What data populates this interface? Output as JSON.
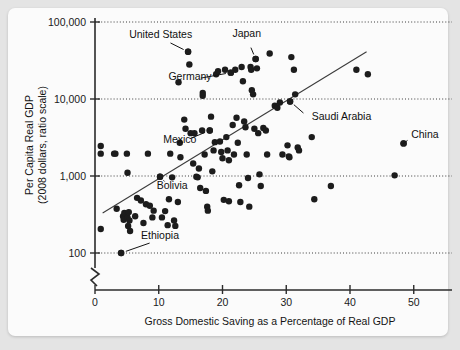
{
  "figure": {
    "title_fragment": "",
    "background_color": "#e4e4e4",
    "card_color": "#fbfbfb"
  },
  "chart_data": {
    "type": "scatter",
    "title": "",
    "xlabel": "Gross Domestic Saving as a Percentage of Real GDP",
    "ylabel_line1": "Per Capita Real GDP",
    "ylabel_line2": "(2008 dollars, ratio scale)",
    "xlim": [
      0,
      56
    ],
    "ylim": [
      100,
      100000
    ],
    "yscale": "log",
    "grid": true,
    "grid_orientation": "horizontal",
    "legend": "none",
    "xticks": [
      0,
      10,
      20,
      30,
      40,
      50
    ],
    "xtick_labels": [
      "0",
      "10",
      "20",
      "30",
      "40",
      "50"
    ],
    "yticks": [
      100,
      1000,
      10000,
      100000
    ],
    "ytick_labels": [
      "100",
      "1,000",
      "10,000",
      "100,000"
    ],
    "axis_break_y": true,
    "marker_color": "#1c1c1c",
    "marker_size": 3.2,
    "trend_line": {
      "label": "fitted trend",
      "x_start": 1.2,
      "y_start": 330,
      "x_end": 42.6,
      "y_end": 41000,
      "color": "#3c3c3c"
    },
    "annotations": [
      {
        "label": "United States",
        "x": 14.6,
        "y": 41000,
        "text_x": 10.3,
        "text_y": 62000,
        "anchor": "middle"
      },
      {
        "label": "Japan",
        "x": 25.2,
        "y": 33000,
        "text_x": 23.8,
        "text_y": 63000,
        "anchor": "middle"
      },
      {
        "label": "Germany",
        "x": 21.3,
        "y": 22000,
        "text_x": 14.9,
        "text_y": 17600,
        "anchor": "middle"
      },
      {
        "label": "Saudi Arabia",
        "x": 30.6,
        "y": 9300,
        "text_x": 34.0,
        "text_y": 5300,
        "anchor": "start"
      },
      {
        "label": "China",
        "x": 48.4,
        "y": 2650,
        "text_x": 49.6,
        "text_y": 3150,
        "anchor": "start"
      },
      {
        "label": "Mexico",
        "x": 18.0,
        "y": 3900,
        "text_x": 13.3,
        "text_y": 2700,
        "anchor": "middle"
      },
      {
        "label": "Bolivia",
        "x": 10.2,
        "y": 980,
        "text_x": 12.1,
        "text_y": 670,
        "anchor": "middle"
      },
      {
        "label": "Ethiopia",
        "x": 4.1,
        "y": 100,
        "text_x": 10.2,
        "text_y": 150,
        "anchor": "middle"
      }
    ],
    "points": [
      {
        "x": 0.9,
        "y": 2450
      },
      {
        "x": 0.9,
        "y": 1950
      },
      {
        "x": 0.9,
        "y": 205
      },
      {
        "x": 3.0,
        "y": 1950
      },
      {
        "x": 3.2,
        "y": 1950
      },
      {
        "x": 5.0,
        "y": 1950
      },
      {
        "x": 5.1,
        "y": 1100
      },
      {
        "x": 8.3,
        "y": 1950
      },
      {
        "x": 3.4,
        "y": 375
      },
      {
        "x": 4.1,
        "y": 100
      },
      {
        "x": 4.4,
        "y": 300
      },
      {
        "x": 4.5,
        "y": 270
      },
      {
        "x": 4.6,
        "y": 330
      },
      {
        "x": 5.1,
        "y": 290
      },
      {
        "x": 5.2,
        "y": 225
      },
      {
        "x": 5.3,
        "y": 340
      },
      {
        "x": 5.4,
        "y": 265
      },
      {
        "x": 5.5,
        "y": 193
      },
      {
        "x": 6.3,
        "y": 300
      },
      {
        "x": 6.6,
        "y": 520
      },
      {
        "x": 7.2,
        "y": 480
      },
      {
        "x": 7.6,
        "y": 245
      },
      {
        "x": 8.0,
        "y": 430
      },
      {
        "x": 8.6,
        "y": 410
      },
      {
        "x": 9.0,
        "y": 290
      },
      {
        "x": 9.2,
        "y": 355
      },
      {
        "x": 10.2,
        "y": 980
      },
      {
        "x": 10.5,
        "y": 290
      },
      {
        "x": 11.0,
        "y": 350
      },
      {
        "x": 11.4,
        "y": 230
      },
      {
        "x": 11.6,
        "y": 500
      },
      {
        "x": 11.8,
        "y": 1950
      },
      {
        "x": 12.1,
        "y": 960
      },
      {
        "x": 12.4,
        "y": 265
      },
      {
        "x": 12.6,
        "y": 225
      },
      {
        "x": 13.0,
        "y": 460
      },
      {
        "x": 13.1,
        "y": 16500
      },
      {
        "x": 13.4,
        "y": 1750
      },
      {
        "x": 13.3,
        "y": 2700
      },
      {
        "x": 14.0,
        "y": 5400
      },
      {
        "x": 14.2,
        "y": 4100
      },
      {
        "x": 14.6,
        "y": 41000
      },
      {
        "x": 14.8,
        "y": 28000
      },
      {
        "x": 15.0,
        "y": 3600
      },
      {
        "x": 15.4,
        "y": 1450
      },
      {
        "x": 15.6,
        "y": 3600
      },
      {
        "x": 15.9,
        "y": 980
      },
      {
        "x": 16.1,
        "y": 960
      },
      {
        "x": 16.3,
        "y": 1250
      },
      {
        "x": 16.5,
        "y": 700
      },
      {
        "x": 16.8,
        "y": 3900
      },
      {
        "x": 16.9,
        "y": 12000
      },
      {
        "x": 16.9,
        "y": 11000
      },
      {
        "x": 17.2,
        "y": 1900
      },
      {
        "x": 17.4,
        "y": 640
      },
      {
        "x": 17.6,
        "y": 400
      },
      {
        "x": 17.7,
        "y": 355
      },
      {
        "x": 18.0,
        "y": 3900
      },
      {
        "x": 18.2,
        "y": 5900
      },
      {
        "x": 18.4,
        "y": 1150
      },
      {
        "x": 18.6,
        "y": 2150
      },
      {
        "x": 18.8,
        "y": 2750
      },
      {
        "x": 19.0,
        "y": 21000
      },
      {
        "x": 19.3,
        "y": 23000
      },
      {
        "x": 19.6,
        "y": 2800
      },
      {
        "x": 19.8,
        "y": 2050
      },
      {
        "x": 20.0,
        "y": 1700
      },
      {
        "x": 20.2,
        "y": 490
      },
      {
        "x": 20.4,
        "y": 24000
      },
      {
        "x": 20.6,
        "y": 3200
      },
      {
        "x": 20.8,
        "y": 2150
      },
      {
        "x": 21.0,
        "y": 1600
      },
      {
        "x": 21.0,
        "y": 470
      },
      {
        "x": 21.3,
        "y": 22000
      },
      {
        "x": 21.6,
        "y": 4600
      },
      {
        "x": 21.8,
        "y": 1900
      },
      {
        "x": 22.0,
        "y": 24000
      },
      {
        "x": 22.2,
        "y": 5700
      },
      {
        "x": 22.4,
        "y": 2700
      },
      {
        "x": 22.6,
        "y": 760
      },
      {
        "x": 22.8,
        "y": 460
      },
      {
        "x": 23.0,
        "y": 26000
      },
      {
        "x": 23.2,
        "y": 17000
      },
      {
        "x": 23.4,
        "y": 5100
      },
      {
        "x": 23.6,
        "y": 4300
      },
      {
        "x": 23.8,
        "y": 1900
      },
      {
        "x": 24.0,
        "y": 940
      },
      {
        "x": 24.2,
        "y": 400
      },
      {
        "x": 24.4,
        "y": 26000
      },
      {
        "x": 24.5,
        "y": 24000
      },
      {
        "x": 24.6,
        "y": 13000
      },
      {
        "x": 24.8,
        "y": 11500
      },
      {
        "x": 25.0,
        "y": 4100
      },
      {
        "x": 25.2,
        "y": 33000
      },
      {
        "x": 25.4,
        "y": 25000
      },
      {
        "x": 25.6,
        "y": 3600
      },
      {
        "x": 25.8,
        "y": 1050
      },
      {
        "x": 26.0,
        "y": 740
      },
      {
        "x": 26.4,
        "y": 4200
      },
      {
        "x": 26.8,
        "y": 3900
      },
      {
        "x": 27.0,
        "y": 1900
      },
      {
        "x": 27.4,
        "y": 39000
      },
      {
        "x": 28.2,
        "y": 8200
      },
      {
        "x": 28.6,
        "y": 7700
      },
      {
        "x": 29.0,
        "y": 9000
      },
      {
        "x": 29.4,
        "y": 1900
      },
      {
        "x": 30.2,
        "y": 2500
      },
      {
        "x": 30.4,
        "y": 1800
      },
      {
        "x": 30.5,
        "y": 1750
      },
      {
        "x": 30.6,
        "y": 9300
      },
      {
        "x": 30.8,
        "y": 35000
      },
      {
        "x": 31.2,
        "y": 24000
      },
      {
        "x": 31.4,
        "y": 11500
      },
      {
        "x": 31.8,
        "y": 2350
      },
      {
        "x": 32.0,
        "y": 2150
      },
      {
        "x": 34.0,
        "y": 3200
      },
      {
        "x": 34.4,
        "y": 500
      },
      {
        "x": 37.0,
        "y": 740
      },
      {
        "x": 41.0,
        "y": 24000
      },
      {
        "x": 42.8,
        "y": 21000
      },
      {
        "x": 47.0,
        "y": 1020
      },
      {
        "x": 48.4,
        "y": 2650
      }
    ]
  }
}
